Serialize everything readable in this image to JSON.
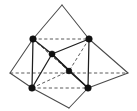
{
  "figure": {
    "type": "line-diagram",
    "width": 137,
    "height": 111,
    "background_color": "#ffffff",
    "solid_edge_color": "#4a4a4a",
    "dashed_edge_color": "#5a5a5a",
    "vertex_color": "#111111",
    "vertex_radius": 3.2,
    "labels": [],
    "points": {
      "apex": {
        "name": "apex",
        "x": 62,
        "y": 5
      },
      "left": {
        "name": "left-corner",
        "x": 10,
        "y": 73
      },
      "right": {
        "name": "right-corner",
        "x": 128,
        "y": 73
      },
      "bottom": {
        "name": "bottom-corner",
        "x": 69,
        "y": 108
      },
      "mid_top_left": {
        "name": "midpoint-top-left",
        "x": 33,
        "y": 39
      },
      "mid_top_right": {
        "name": "midpoint-top-right",
        "x": 89,
        "y": 39
      },
      "mid_upper_center": {
        "name": "midpoint-upper-center",
        "x": 52,
        "y": 54
      },
      "mid_center": {
        "name": "midpoint-center",
        "x": 69,
        "y": 71
      },
      "mid_bottom_left": {
        "name": "midpoint-bottom-left",
        "x": 32,
        "y": 88
      },
      "mid_bottom_right": {
        "name": "midpoint-bottom-right",
        "x": 88,
        "y": 88
      }
    },
    "vertices_marked": [
      {
        "id": "v1",
        "label": "",
        "x": 33,
        "y": 39
      },
      {
        "id": "v2",
        "label": "",
        "x": 89,
        "y": 39
      },
      {
        "id": "v3",
        "label": "",
        "x": 52,
        "y": 54
      },
      {
        "id": "v4",
        "label": "",
        "x": 69,
        "y": 71
      },
      {
        "id": "v5",
        "label": "",
        "x": 32,
        "y": 88
      },
      {
        "id": "v6",
        "label": "",
        "x": 88,
        "y": 88
      }
    ],
    "solid_edges": [
      {
        "id": "e1",
        "from": "apex",
        "to": "mid_top_left",
        "x1": 62,
        "y1": 5,
        "x2": 33,
        "y2": 39
      },
      {
        "id": "e2",
        "from": "apex",
        "to": "mid_top_right",
        "x1": 62,
        "y1": 5,
        "x2": 89,
        "y2": 39
      },
      {
        "id": "e3",
        "from": "mid_top_left",
        "to": "mid_upper_center",
        "x1": 33,
        "y1": 39,
        "x2": 52,
        "y2": 54
      },
      {
        "id": "e4",
        "from": "mid_upper_center",
        "to": "mid_top_right",
        "x1": 52,
        "y1": 54,
        "x2": 89,
        "y2": 39
      },
      {
        "id": "e5",
        "from": "mid_top_left",
        "to": "left",
        "x1": 33,
        "y1": 39,
        "x2": 10,
        "y2": 73
      },
      {
        "id": "e6",
        "from": "mid_top_right",
        "to": "right",
        "x1": 89,
        "y1": 39,
        "x2": 128,
        "y2": 73
      },
      {
        "id": "e7",
        "from": "left",
        "to": "mid_bottom_left",
        "x1": 10,
        "y1": 73,
        "x2": 32,
        "y2": 88
      },
      {
        "id": "e8",
        "from": "right",
        "to": "mid_bottom_right",
        "x1": 128,
        "y1": 73,
        "x2": 88,
        "y2": 88
      },
      {
        "id": "e9",
        "from": "mid_bottom_left",
        "to": "bottom",
        "x1": 32,
        "y1": 88,
        "x2": 69,
        "y2": 108
      },
      {
        "id": "e10",
        "from": "bottom",
        "to": "mid_bottom_right",
        "x1": 69,
        "y1": 108,
        "x2": 88,
        "y2": 88
      },
      {
        "id": "e11",
        "from": "mid_top_left",
        "to": "mid_bottom_left",
        "x1": 33,
        "y1": 39,
        "x2": 32,
        "y2": 88
      },
      {
        "id": "e12",
        "from": "mid_top_right",
        "to": "mid_bottom_right",
        "x1": 89,
        "y1": 39,
        "x2": 88,
        "y2": 88
      },
      {
        "id": "e13",
        "from": "mid_upper_center",
        "to": "mid_bottom_left",
        "x1": 52,
        "y1": 54,
        "x2": 32,
        "y2": 88
      },
      {
        "id": "e14",
        "from": "mid_upper_center",
        "to": "mid_bottom_right",
        "x1": 52,
        "y1": 54,
        "x2": 88,
        "y2": 88
      },
      {
        "id": "e15",
        "from": "mid_upper_center",
        "to": "mid_center",
        "x1": 52,
        "y1": 54,
        "x2": 69,
        "y2": 71
      },
      {
        "id": "e16",
        "from": "mid_center",
        "to": "mid_bottom_right",
        "x1": 69,
        "y1": 71,
        "x2": 88,
        "y2": 88
      },
      {
        "id": "e17",
        "from": "left",
        "to": "mid_top_left-lower",
        "x1": 10,
        "y1": 73,
        "x2": 33,
        "y2": 39
      }
    ],
    "dashed_edges": [
      {
        "id": "d1",
        "from": "mid_top_left",
        "to": "mid_top_right",
        "x1": 33,
        "y1": 39,
        "x2": 89,
        "y2": 39
      },
      {
        "id": "d2",
        "from": "left",
        "to": "right",
        "x1": 10,
        "y1": 73,
        "x2": 128,
        "y2": 73
      },
      {
        "id": "d3",
        "from": "mid_bottom_left",
        "to": "mid_bottom_right",
        "x1": 32,
        "y1": 88,
        "x2": 88,
        "y2": 88
      },
      {
        "id": "d4",
        "from": "mid_top_left",
        "to": "mid_center",
        "x1": 33,
        "y1": 39,
        "x2": 69,
        "y2": 71
      },
      {
        "id": "d5",
        "from": "mid_top_right",
        "to": "mid_center",
        "x1": 89,
        "y1": 39,
        "x2": 69,
        "y2": 71
      },
      {
        "id": "d6",
        "from": "mid_bottom_left",
        "to": "mid_center",
        "x1": 32,
        "y1": 88,
        "x2": 69,
        "y2": 71
      },
      {
        "id": "d7",
        "from": "mid_top_left",
        "to": "bottom-hidden",
        "x1": 33,
        "y1": 39,
        "x2": 69,
        "y2": 71
      },
      {
        "id": "d8",
        "from": "mid_upper_center",
        "to": "bottom",
        "x1": 52,
        "y1": 54,
        "x2": 69,
        "y2": 108
      }
    ]
  }
}
